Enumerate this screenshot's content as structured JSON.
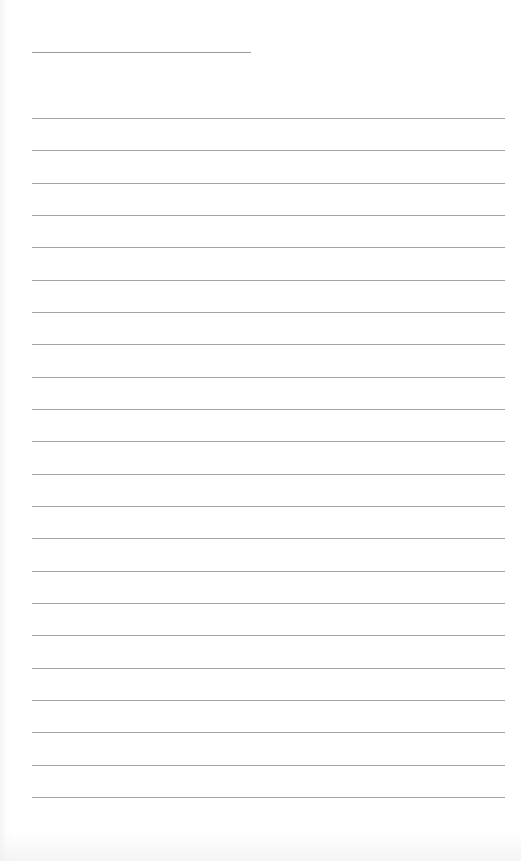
{
  "page": {
    "type": "lined-paper",
    "title_line": {
      "left": 32,
      "top": 52,
      "width": 219
    },
    "rules": {
      "count": 22,
      "left": 32,
      "width": 473,
      "first_top": 118,
      "spacing": 32.33
    },
    "colors": {
      "paper": "#ffffff",
      "line": "#a2a2a2",
      "title_line": "#9a9a9a"
    }
  }
}
